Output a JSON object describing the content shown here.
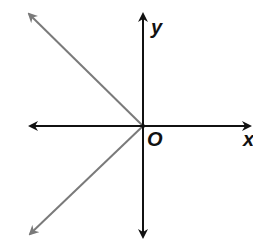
{
  "diagram": {
    "type": "coordinate-plane",
    "labels": {
      "x_axis": "x",
      "y_axis": "y",
      "origin": "O"
    },
    "origin_px": [
      143,
      126
    ],
    "axes": {
      "color": "#111111",
      "x_axis": {
        "from": [
          30,
          126
        ],
        "to": [
          250,
          126
        ]
      },
      "y_axis": {
        "from": [
          143,
          237
        ],
        "to": [
          143,
          14
        ]
      }
    },
    "rays": [
      {
        "name": "upper-left-ray",
        "from": [
          143,
          126
        ],
        "to": [
          27,
          12
        ],
        "color": "#7a7a7a"
      },
      {
        "name": "lower-left-ray",
        "from": [
          143,
          126
        ],
        "to": [
          28,
          236
        ],
        "color": "#7a7a7a"
      }
    ]
  }
}
